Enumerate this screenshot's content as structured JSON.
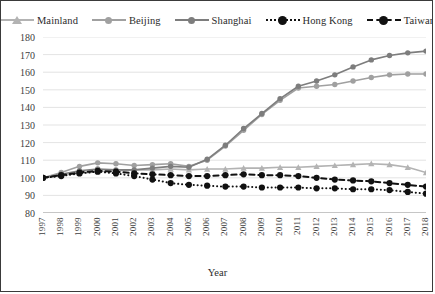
{
  "chart_data": {
    "type": "line",
    "title": "",
    "xlabel": "Year",
    "ylabel": "",
    "grid": true,
    "legend_position": "top",
    "ylim": [
      80,
      180
    ],
    "yticks": [
      80,
      90,
      100,
      110,
      120,
      130,
      140,
      150,
      160,
      170,
      180
    ],
    "categories": [
      "1997",
      "1998",
      "1999",
      "2000",
      "2001",
      "2002",
      "2003",
      "2004",
      "2005",
      "2006",
      "2007",
      "2008",
      "2009",
      "2010",
      "2011",
      "2012",
      "2013",
      "2014",
      "2015",
      "2016",
      "2017",
      "2018"
    ],
    "series": [
      {
        "name": "Mainland",
        "color": "#b3b3b3",
        "marker": "triangle",
        "dash": "solid",
        "values": [
          100.0,
          101.5,
          102.5,
          103.5,
          104.0,
          104.5,
          104.5,
          105.0,
          104.5,
          105.0,
          105.0,
          105.5,
          105.5,
          106.0,
          106.0,
          106.5,
          107.0,
          107.5,
          108.0,
          107.5,
          106.0,
          103.0
        ]
      },
      {
        "name": "Beijing",
        "color": "#a0a0a0",
        "marker": "circle",
        "dash": "solid",
        "values": [
          100.0,
          103.0,
          106.5,
          108.5,
          108.0,
          107.0,
          107.5,
          108.0,
          106.5,
          110.0,
          118.0,
          127.0,
          136.0,
          144.0,
          151.0,
          152.0,
          153.0,
          155.0,
          157.0,
          158.5,
          159.0,
          159.0
        ]
      },
      {
        "name": "Shanghai",
        "color": "#7d7d7d",
        "marker": "circle",
        "dash": "solid",
        "values": [
          100.0,
          102.0,
          104.0,
          105.0,
          104.5,
          104.5,
          105.5,
          106.5,
          106.0,
          110.5,
          118.5,
          128.0,
          136.5,
          145.0,
          152.0,
          155.0,
          158.5,
          163.0,
          167.0,
          169.5,
          171.0,
          172.0
        ]
      },
      {
        "name": "Hong Kong",
        "color": "#111111",
        "marker": "circle",
        "dash": "dotted",
        "values": [
          100.0,
          101.0,
          102.5,
          103.5,
          102.5,
          101.0,
          99.0,
          97.0,
          96.0,
          95.5,
          95.0,
          95.0,
          94.5,
          94.5,
          94.5,
          94.0,
          94.0,
          93.5,
          93.5,
          93.0,
          92.0,
          91.0
        ]
      },
      {
        "name": "Taiwan",
        "color": "#111111",
        "marker": "circle",
        "dash": "dashed",
        "values": [
          100.0,
          101.5,
          103.0,
          104.0,
          103.5,
          102.5,
          102.0,
          101.5,
          101.0,
          101.0,
          101.5,
          102.0,
          101.5,
          101.5,
          101.0,
          100.0,
          99.0,
          98.5,
          98.0,
          97.0,
          96.0,
          95.0
        ]
      }
    ]
  },
  "legend": {
    "items": [
      {
        "label": "Mainland"
      },
      {
        "label": "Beijing"
      },
      {
        "label": "Shanghai"
      },
      {
        "label": "Hong Kong"
      },
      {
        "label": "Taiwan"
      }
    ]
  },
  "axis": {
    "x_title": "Year"
  }
}
